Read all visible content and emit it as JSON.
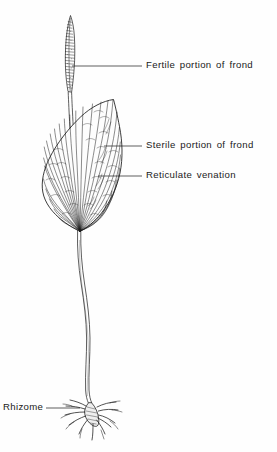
{
  "figure": {
    "background_color": "#fefefe",
    "ink_color": "#1a1a1a",
    "width": 277,
    "height": 452
  },
  "labels": {
    "fertile": "Fertile portion of  frond",
    "sterile": "Sterile portion of  frond",
    "reticulate": "Reticulate  venation",
    "rhizome": "Rhizome"
  },
  "leader_lines": [
    {
      "name": "fertile-leader",
      "x1": 72,
      "y1": 66,
      "x2": 142,
      "y2": 66
    },
    {
      "name": "sterile-leader",
      "x1": 104,
      "y1": 146,
      "x2": 142,
      "y2": 146
    },
    {
      "name": "reticulate-leader",
      "x1": 98,
      "y1": 176,
      "x2": 142,
      "y2": 176
    },
    {
      "name": "rhizome-leader",
      "x1": 46,
      "y1": 408,
      "x2": 78,
      "y2": 408
    }
  ],
  "parts": {
    "fertile_spike": {
      "top": 15,
      "bottom": 95,
      "center_x": 72
    },
    "sterile_blade": {
      "top": 95,
      "bottom": 232,
      "left": 42,
      "right": 122
    },
    "stalk": {
      "top": 232,
      "bottom": 400,
      "center_x": 80
    },
    "rhizome": {
      "top": 398,
      "bottom": 440,
      "center_x": 92
    }
  }
}
